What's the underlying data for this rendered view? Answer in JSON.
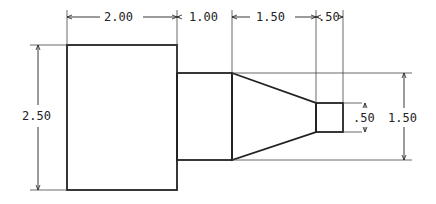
{
  "drawing": {
    "type": "dimensioned part drawing",
    "stroke_color": "#222222",
    "dimensions": {
      "top": [
        {
          "label": "2.00",
          "segment": "large-cylinder-length"
        },
        {
          "label": "1.00",
          "segment": "neck-length"
        },
        {
          "label": "1.50",
          "segment": "taper-length"
        },
        {
          "label": ".50",
          "segment": "tip-length"
        }
      ],
      "left": {
        "label": "2.50",
        "segment": "large-cylinder-height"
      },
      "right_inner": {
        "label": ".50",
        "segment": "tip-height"
      },
      "right_outer": {
        "label": "1.50",
        "segment": "neck-height"
      }
    }
  }
}
